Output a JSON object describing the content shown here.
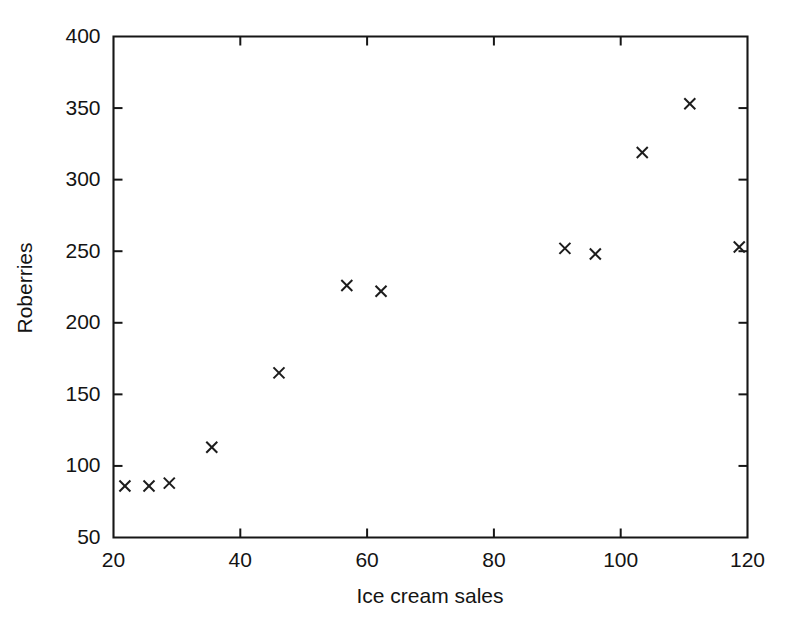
{
  "chart_data": {
    "type": "scatter",
    "title": "",
    "xlabel": "Ice cream sales",
    "ylabel": "Roberries",
    "xlim": [
      20,
      120
    ],
    "ylim": [
      50,
      400
    ],
    "xticks": [
      20,
      40,
      60,
      80,
      100,
      120
    ],
    "yticks": [
      50,
      100,
      150,
      200,
      250,
      300,
      350,
      400
    ],
    "xtick_labels": [
      "20",
      "40",
      "60",
      "80",
      "100",
      "120"
    ],
    "ytick_labels": [
      "50",
      "100",
      "150",
      "200",
      "250",
      "300",
      "350",
      "400"
    ],
    "grid": false,
    "legend": false,
    "marker": "x",
    "marker_color": "#1c1c1c",
    "series": [
      {
        "name": "observations",
        "x": [
          21.8,
          25.6,
          28.8,
          35.5,
          46.1,
          56.8,
          62.2,
          91.2,
          96.0,
          103.4,
          110.9,
          118.7
        ],
        "y": [
          86,
          86,
          88,
          113,
          165,
          226,
          222,
          252,
          248,
          319,
          353,
          253
        ]
      }
    ]
  },
  "figure": {
    "background_color": "#ffffff",
    "axis_color": "#161616"
  }
}
